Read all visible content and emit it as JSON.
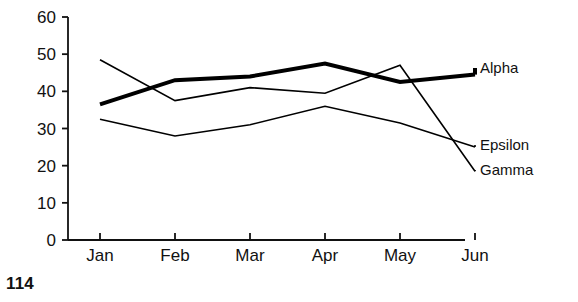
{
  "page": {
    "number": "114"
  },
  "chart_data": {
    "type": "line",
    "title": "",
    "subtitle": "",
    "xlabel": "",
    "ylabel": "",
    "categories": [
      "Jan",
      "Feb",
      "Mar",
      "Apr",
      "May",
      "Jun"
    ],
    "ylim": [
      0,
      60
    ],
    "yticks": [
      "0",
      "10",
      "20",
      "30",
      "40",
      "50",
      "60"
    ],
    "ytick_values": [
      0,
      10,
      20,
      30,
      40,
      50,
      60
    ],
    "grid": false,
    "legend_position": "right-inline-end-of-line",
    "series": [
      {
        "name": "Alpha",
        "values": [
          36.5,
          43,
          44,
          47.5,
          42.5,
          44.5
        ],
        "style": "bold",
        "color": "#000000",
        "linewidth": 4,
        "label_y_value": 44.5
      },
      {
        "name": "Epsilon",
        "values": [
          32.5,
          28,
          31,
          36,
          31.5,
          25
        ],
        "style": "thin",
        "color": "#000000",
        "linewidth": 1.6,
        "label_y_value": 25
      },
      {
        "name": "Gamma",
        "values": [
          48.5,
          37.5,
          41,
          39.5,
          47,
          18.5
        ],
        "style": "thin",
        "color": "#000000",
        "linewidth": 1.6,
        "label_y_value": 18.5
      }
    ],
    "axis_color": "#111111"
  }
}
